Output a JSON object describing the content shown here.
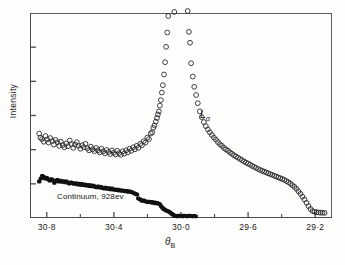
{
  "figure": {
    "background": "#fdfdfc",
    "frame_color": "#4a4a4a"
  },
  "axes": {
    "y_label": "Intensity",
    "x_label": "θ",
    "x_label_sub": "B",
    "x_tick_labels": [
      "30·8",
      "30·4",
      "30·0",
      "29·6",
      "29·2"
    ],
    "x_minor_ticks": [
      "30·6",
      "30·2",
      "29·8",
      "29·4"
    ],
    "y_tick_count": 5
  },
  "annotations": {
    "continuum": "Continuum, 928ev",
    "lalpha": "L",
    "lalpha_sub": "α"
  },
  "chart_data": {
    "type": "scatter",
    "title": "",
    "xlabel": "θ_B",
    "ylabel": "Intensity",
    "xlim": [
      30.9,
      29.1
    ],
    "ylim": [
      0,
      1.0
    ],
    "x_axis_reversed": true,
    "grid": false,
    "legend": "none",
    "x_ticks_major": [
      30.8,
      30.4,
      30.0,
      29.6,
      29.2
    ],
    "x_ticks_minor": [
      30.6,
      30.2,
      29.8,
      29.4
    ],
    "series": [
      {
        "name": "Lα emission line",
        "marker": "open-circle",
        "marker_color": "#2b2b2b",
        "points": [
          [
            30.845,
            0.412
          ],
          [
            30.838,
            0.392
          ],
          [
            30.828,
            0.385
          ],
          [
            30.818,
            0.372
          ],
          [
            30.808,
            0.4
          ],
          [
            30.798,
            0.383
          ],
          [
            30.789,
            0.368
          ],
          [
            30.779,
            0.39
          ],
          [
            30.768,
            0.375
          ],
          [
            30.757,
            0.358
          ],
          [
            30.747,
            0.381
          ],
          [
            30.737,
            0.369
          ],
          [
            30.726,
            0.352
          ],
          [
            30.716,
            0.372
          ],
          [
            30.705,
            0.356
          ],
          [
            30.695,
            0.345
          ],
          [
            30.684,
            0.364
          ],
          [
            30.674,
            0.35
          ],
          [
            30.663,
            0.378
          ],
          [
            30.653,
            0.361
          ],
          [
            30.642,
            0.342
          ],
          [
            30.632,
            0.358
          ],
          [
            30.621,
            0.37
          ],
          [
            30.611,
            0.352
          ],
          [
            30.6,
            0.338
          ],
          [
            30.59,
            0.355
          ],
          [
            30.579,
            0.345
          ],
          [
            30.569,
            0.362
          ],
          [
            30.558,
            0.34
          ],
          [
            30.548,
            0.33
          ],
          [
            30.537,
            0.348
          ],
          [
            30.527,
            0.335
          ],
          [
            30.516,
            0.326
          ],
          [
            30.506,
            0.342
          ],
          [
            30.495,
            0.33
          ],
          [
            30.485,
            0.32
          ],
          [
            30.474,
            0.338
          ],
          [
            30.464,
            0.325
          ],
          [
            30.453,
            0.315
          ],
          [
            30.443,
            0.332
          ],
          [
            30.432,
            0.322
          ],
          [
            30.422,
            0.312
          ],
          [
            30.411,
            0.33
          ],
          [
            30.401,
            0.318
          ],
          [
            30.39,
            0.31
          ],
          [
            30.38,
            0.328
          ],
          [
            30.369,
            0.316
          ],
          [
            30.359,
            0.308
          ],
          [
            30.348,
            0.325
          ],
          [
            30.338,
            0.314
          ],
          [
            30.327,
            0.33
          ],
          [
            30.317,
            0.32
          ],
          [
            30.306,
            0.338
          ],
          [
            30.296,
            0.328
          ],
          [
            30.285,
            0.345
          ],
          [
            30.275,
            0.335
          ],
          [
            30.264,
            0.352
          ],
          [
            30.254,
            0.342
          ],
          [
            30.243,
            0.362
          ],
          [
            30.233,
            0.355
          ],
          [
            30.222,
            0.375
          ],
          [
            30.212,
            0.368
          ],
          [
            30.201,
            0.392
          ],
          [
            30.191,
            0.385
          ],
          [
            30.18,
            0.412
          ],
          [
            30.172,
            0.418
          ],
          [
            30.165,
            0.44
          ],
          [
            30.158,
            0.452
          ],
          [
            30.15,
            0.47
          ],
          [
            30.143,
            0.488
          ],
          [
            30.138,
            0.505
          ],
          [
            30.132,
            0.52
          ],
          [
            30.126,
            0.548
          ],
          [
            30.12,
            0.575
          ],
          [
            30.114,
            0.612
          ],
          [
            30.108,
            0.648
          ],
          [
            30.101,
            0.7
          ],
          [
            30.095,
            0.76
          ],
          [
            30.089,
            0.835
          ],
          [
            30.082,
            0.905
          ],
          [
            30.076,
            0.985
          ],
          [
            30.04,
            1.005
          ],
          [
            29.96,
            1.01
          ],
          [
            29.953,
            0.908
          ],
          [
            29.946,
            0.855
          ],
          [
            29.94,
            0.755
          ],
          [
            29.93,
            0.69
          ],
          [
            29.921,
            0.64
          ],
          [
            29.91,
            0.6
          ],
          [
            29.9,
            0.56
          ],
          [
            29.888,
            0.52
          ],
          [
            29.876,
            0.492
          ],
          [
            29.864,
            0.468
          ],
          [
            29.852,
            0.448
          ],
          [
            29.84,
            0.432
          ],
          [
            29.828,
            0.418
          ],
          [
            29.816,
            0.405
          ],
          [
            29.804,
            0.392
          ],
          [
            29.792,
            0.382
          ],
          [
            29.78,
            0.37
          ],
          [
            29.768,
            0.36
          ],
          [
            29.756,
            0.352
          ],
          [
            29.744,
            0.342
          ],
          [
            29.732,
            0.335
          ],
          [
            29.72,
            0.328
          ],
          [
            29.708,
            0.32
          ],
          [
            29.696,
            0.313
          ],
          [
            29.684,
            0.306
          ],
          [
            29.672,
            0.3
          ],
          [
            29.66,
            0.294
          ],
          [
            29.648,
            0.288
          ],
          [
            29.636,
            0.282
          ],
          [
            29.624,
            0.276
          ],
          [
            29.612,
            0.27
          ],
          [
            29.6,
            0.265
          ],
          [
            29.588,
            0.26
          ],
          [
            29.576,
            0.254
          ],
          [
            29.564,
            0.249
          ],
          [
            29.552,
            0.244
          ],
          [
            29.54,
            0.239
          ],
          [
            29.528,
            0.234
          ],
          [
            29.516,
            0.23
          ],
          [
            29.504,
            0.226
          ],
          [
            29.492,
            0.222
          ],
          [
            29.48,
            0.218
          ],
          [
            29.468,
            0.214
          ],
          [
            29.456,
            0.21
          ],
          [
            29.444,
            0.206
          ],
          [
            29.432,
            0.202
          ],
          [
            29.42,
            0.198
          ],
          [
            29.408,
            0.194
          ],
          [
            29.396,
            0.19
          ],
          [
            29.384,
            0.186
          ],
          [
            29.372,
            0.18
          ],
          [
            29.36,
            0.175
          ],
          [
            29.348,
            0.168
          ],
          [
            29.336,
            0.16
          ],
          [
            29.324,
            0.152
          ],
          [
            29.312,
            0.142
          ],
          [
            29.3,
            0.13
          ],
          [
            29.288,
            0.118
          ],
          [
            29.276,
            0.104
          ],
          [
            29.264,
            0.09
          ],
          [
            29.252,
            0.074
          ],
          [
            29.24,
            0.058
          ],
          [
            29.228,
            0.044
          ],
          [
            29.216,
            0.034
          ],
          [
            29.204,
            0.03
          ],
          [
            29.192,
            0.028
          ],
          [
            29.18,
            0.027
          ],
          [
            29.168,
            0.026
          ],
          [
            29.156,
            0.026
          ],
          [
            29.144,
            0.025
          ]
        ]
      },
      {
        "name": "Continuum, 928ev",
        "marker": "filled-circle",
        "marker_color": "#111111",
        "points": [
          [
            30.845,
            0.178
          ],
          [
            30.836,
            0.192
          ],
          [
            30.827,
            0.205
          ],
          [
            30.818,
            0.2
          ],
          [
            30.809,
            0.192
          ],
          [
            30.8,
            0.196
          ],
          [
            30.791,
            0.188
          ],
          [
            30.782,
            0.182
          ],
          [
            30.773,
            0.19
          ],
          [
            30.764,
            0.185
          ],
          [
            30.755,
            0.172
          ],
          [
            30.746,
            0.18
          ],
          [
            30.737,
            0.186
          ],
          [
            30.728,
            0.178
          ],
          [
            30.719,
            0.182
          ],
          [
            30.71,
            0.176
          ],
          [
            30.701,
            0.18
          ],
          [
            30.692,
            0.174
          ],
          [
            30.683,
            0.178
          ],
          [
            30.674,
            0.172
          ],
          [
            30.665,
            0.168
          ],
          [
            30.656,
            0.174
          ],
          [
            30.647,
            0.17
          ],
          [
            30.638,
            0.166
          ],
          [
            30.629,
            0.17
          ],
          [
            30.62,
            0.164
          ],
          [
            30.611,
            0.168
          ],
          [
            30.602,
            0.162
          ],
          [
            30.593,
            0.166
          ],
          [
            30.584,
            0.16
          ],
          [
            30.575,
            0.164
          ],
          [
            30.566,
            0.158
          ],
          [
            30.557,
            0.162
          ],
          [
            30.548,
            0.156
          ],
          [
            30.539,
            0.16
          ],
          [
            30.53,
            0.154
          ],
          [
            30.521,
            0.158
          ],
          [
            30.512,
            0.152
          ],
          [
            30.503,
            0.15
          ],
          [
            30.494,
            0.154
          ],
          [
            30.485,
            0.148
          ],
          [
            30.476,
            0.152
          ],
          [
            30.467,
            0.146
          ],
          [
            30.458,
            0.144
          ],
          [
            30.449,
            0.148
          ],
          [
            30.44,
            0.142
          ],
          [
            30.431,
            0.146
          ],
          [
            30.422,
            0.14
          ],
          [
            30.413,
            0.144
          ],
          [
            30.404,
            0.138
          ],
          [
            30.395,
            0.14
          ],
          [
            30.386,
            0.136
          ],
          [
            30.377,
            0.138
          ],
          [
            30.368,
            0.134
          ],
          [
            30.359,
            0.136
          ],
          [
            30.35,
            0.132
          ],
          [
            30.341,
            0.134
          ],
          [
            30.332,
            0.13
          ],
          [
            30.323,
            0.132
          ],
          [
            30.314,
            0.128
          ],
          [
            30.305,
            0.13
          ],
          [
            30.296,
            0.126
          ],
          [
            30.287,
            0.124
          ],
          [
            30.278,
            0.12
          ],
          [
            30.27,
            0.118
          ],
          [
            30.262,
            0.114
          ],
          [
            30.255,
            0.096
          ],
          [
            30.247,
            0.092
          ],
          [
            30.239,
            0.088
          ],
          [
            30.231,
            0.084
          ],
          [
            30.223,
            0.086
          ],
          [
            30.215,
            0.082
          ],
          [
            30.207,
            0.08
          ],
          [
            30.199,
            0.078
          ],
          [
            30.191,
            0.08
          ],
          [
            30.183,
            0.076
          ],
          [
            30.175,
            0.078
          ],
          [
            30.167,
            0.074
          ],
          [
            30.159,
            0.076
          ],
          [
            30.151,
            0.072
          ],
          [
            30.143,
            0.074
          ],
          [
            30.135,
            0.07
          ],
          [
            30.127,
            0.068
          ],
          [
            30.119,
            0.058
          ],
          [
            30.111,
            0.05
          ],
          [
            30.103,
            0.044
          ],
          [
            30.095,
            0.04
          ],
          [
            30.087,
            0.036
          ],
          [
            30.079,
            0.034
          ],
          [
            30.071,
            0.03
          ],
          [
            30.063,
            0.026
          ],
          [
            30.055,
            0.02
          ],
          [
            30.047,
            0.016
          ],
          [
            30.039,
            0.012
          ],
          [
            30.031,
            0.01
          ],
          [
            30.022,
            0.008
          ],
          [
            30.012,
            0.012
          ],
          [
            30.002,
            0.01
          ],
          [
            29.992,
            0.008
          ],
          [
            29.982,
            0.012
          ],
          [
            29.972,
            0.01
          ],
          [
            29.962,
            0.008
          ],
          [
            29.952,
            0.012
          ],
          [
            29.942,
            0.01
          ],
          [
            29.932,
            0.008
          ],
          [
            29.922,
            0.01
          ],
          [
            29.912,
            0.008
          ]
        ]
      }
    ]
  }
}
